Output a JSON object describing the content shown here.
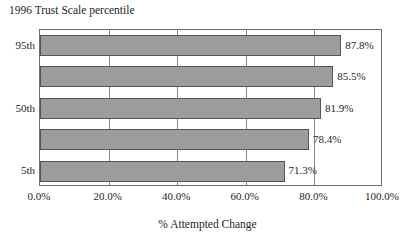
{
  "chart_data": {
    "type": "bar",
    "orientation": "horizontal",
    "title": "1996 Trust Scale percentile",
    "xlabel": "% Attempted Change",
    "ylabel": "",
    "categories": [
      "95th",
      "",
      "50th",
      "",
      "5th"
    ],
    "values": [
      87.8,
      85.5,
      81.9,
      78.4,
      71.3
    ],
    "data_labels": [
      "87.8%",
      "85.5%",
      "81.9%",
      "78.4%",
      "71.3%"
    ],
    "xlim": [
      0,
      100
    ],
    "xticks": [
      0,
      20,
      40,
      60,
      80,
      100
    ],
    "xtick_labels": [
      "0.0%",
      "20.0%",
      "40.0%",
      "60.0%",
      "80.0%",
      "100.0%"
    ],
    "grid": true,
    "grid_axis": "x",
    "legend": false,
    "bar_color": "#9c9c9c",
    "bar_border_color": "#555555",
    "plot_border_color": "#6e6e6e",
    "gridline_color": "#8a8a8a",
    "text_color": "#262626",
    "background": "#ffffff"
  }
}
